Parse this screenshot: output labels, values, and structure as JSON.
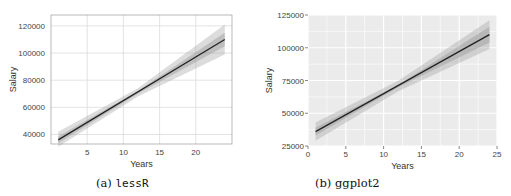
{
  "chart_data": [
    {
      "type": "line",
      "title": "",
      "caption_label": "(a)",
      "caption_name": "lessR",
      "xlabel": "Years",
      "ylabel": "Salary",
      "xlim": [
        0,
        25
      ],
      "ylim": [
        33000,
        128000
      ],
      "xticks": [
        5,
        10,
        15,
        20
      ],
      "yticks": [
        40000,
        60000,
        80000,
        100000,
        120000
      ],
      "ytick_labels": [
        "40000",
        "60000",
        "80000",
        "100000",
        "120000"
      ],
      "xtick_labels": [
        "5",
        "10",
        "15",
        "20"
      ],
      "grid": true,
      "legend": "none",
      "series": [
        {
          "name": "Fitted regression line",
          "x": [
            1,
            24
          ],
          "y": [
            36000,
            110000
          ]
        },
        {
          "name": "Confidence band (inner)",
          "x": [
            1,
            12,
            24
          ],
          "lower": [
            33500,
            70000,
            105000
          ],
          "upper": [
            38500,
            72000,
            115000
          ]
        },
        {
          "name": "Prediction band (outer)",
          "x": [
            1,
            12,
            24
          ],
          "lower": [
            31000,
            68000,
            99000
          ],
          "upper": [
            42000,
            74000,
            121000
          ]
        }
      ],
      "style": {
        "panel_bg": "#ffffff",
        "grid_color": "#dcdcdc",
        "line_color": "#222222",
        "band_color": "#9a9a9a"
      }
    },
    {
      "type": "line",
      "title": "",
      "caption_label": "(b)",
      "caption_name": "ggplot2",
      "xlabel": "Years",
      "ylabel": "Salary",
      "xlim": [
        0,
        25
      ],
      "ylim": [
        25000,
        125000
      ],
      "xticks": [
        0,
        5,
        10,
        15,
        20,
        25
      ],
      "yticks": [
        25000,
        50000,
        75000,
        100000,
        125000
      ],
      "ytick_labels": [
        "25000",
        "50000",
        "75000",
        "100000",
        "125000"
      ],
      "xtick_labels": [
        "0",
        "5",
        "10",
        "15",
        "20",
        "25"
      ],
      "grid": true,
      "legend": "none",
      "series": [
        {
          "name": "Fitted regression line",
          "x": [
            1,
            24
          ],
          "y": [
            36000,
            110000
          ]
        },
        {
          "name": "Confidence band (inner)",
          "x": [
            1,
            12,
            24
          ],
          "lower": [
            33000,
            70000,
            104000
          ],
          "upper": [
            39000,
            72000,
            116000
          ]
        },
        {
          "name": "Prediction band (outer)",
          "x": [
            1,
            12,
            24
          ],
          "lower": [
            29000,
            67000,
            99000
          ],
          "upper": [
            43000,
            75000,
            121000
          ]
        }
      ],
      "style": {
        "panel_bg": "#ebebeb",
        "grid_color": "#ffffff",
        "line_color": "#222222",
        "band_color": "#9a9a9a"
      }
    }
  ]
}
